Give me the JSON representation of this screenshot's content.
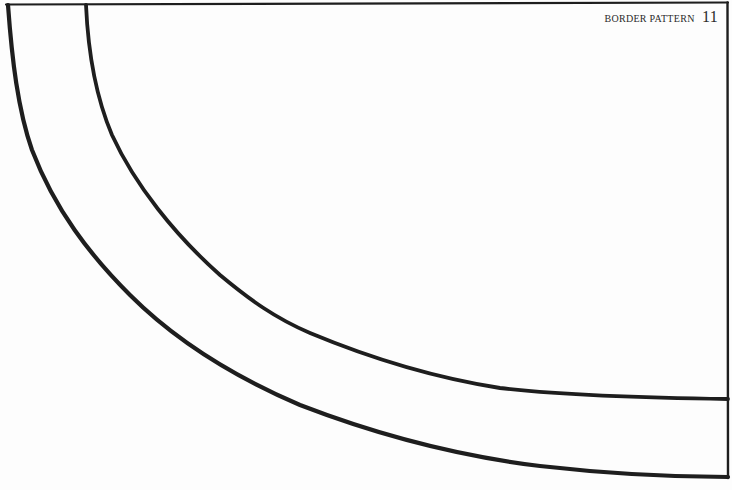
{
  "page": {
    "title_text": "BORDER PATTERN",
    "pattern_number": "11",
    "colors": {
      "line": "#1e1e1e",
      "paper": "#fdfdfd",
      "text": "#2a2a2a"
    }
  },
  "pattern": {
    "name": "border-pattern-11",
    "pieces": [
      {
        "name": "border-strip",
        "description": "curved border strip between outer and inner edge curves"
      },
      {
        "name": "center-area",
        "description": "quarter-oval interior region"
      }
    ]
  }
}
